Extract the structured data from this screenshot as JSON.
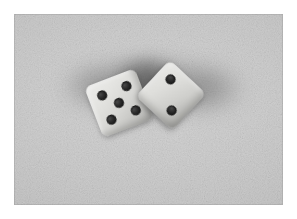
{
  "image": {
    "kind": "photograph",
    "subject": "two white dice on a light gray textured surface",
    "caption": "Two dice resting on a gray surface, left die showing five, right die showing two",
    "alt_text": "Close-up photograph of a pair of white dice with black pips on a gray grainy background",
    "orientation": "landscape",
    "width_px": 297,
    "height_px": 219,
    "border": {
      "style": "white-margin",
      "margin_px": 14,
      "color": "#ffffff"
    },
    "plate": {
      "left_px": 14,
      "top_px": 14,
      "width_px": 269,
      "height_px": 191
    }
  },
  "palette": {
    "page_background": "#ffffff",
    "surface_light": "#d2d2d2",
    "surface_mid": "#c4c4c4",
    "surface_dark": "#b6b6b6",
    "shadow": "#707070",
    "die_highlight": "#ececea",
    "die_midtone": "#d6d6d3",
    "die_shade": "#a4a4a1",
    "pip": "#161616"
  },
  "scene": {
    "total_pip_count": 7,
    "dice_count": 2,
    "shadow": {
      "name": "cast-shadow",
      "description": "soft dark blur spreading behind and beneath both dice",
      "direction": "upward and outward"
    }
  },
  "dice": [
    {
      "id": "die-left",
      "name": "left-die",
      "value": 5,
      "face_label": "five",
      "pip_pattern": "quincunx",
      "rotation_deg": -21,
      "size_px": 54,
      "position": {
        "left_px": 78,
        "top_px": 62
      },
      "pips": [
        {
          "name": "pip-top-left",
          "x_pct": 26,
          "y_pct": 26,
          "size_px": 10
        },
        {
          "name": "pip-top-right",
          "x_pct": 74,
          "y_pct": 26,
          "size_px": 10
        },
        {
          "name": "pip-center",
          "x_pct": 50,
          "y_pct": 50,
          "size_px": 10
        },
        {
          "name": "pip-bottom-left",
          "x_pct": 26,
          "y_pct": 74,
          "size_px": 10
        },
        {
          "name": "pip-bottom-right",
          "x_pct": 74,
          "y_pct": 74,
          "size_px": 10
        }
      ]
    },
    {
      "id": "die-right",
      "name": "right-die",
      "value": 2,
      "face_label": "two",
      "pip_pattern": "diagonal",
      "rotation_deg": 43,
      "size_px": 50,
      "position": {
        "left_px": 132,
        "top_px": 56
      },
      "pips": [
        {
          "name": "pip-upper",
          "x_pct": 28,
          "y_pct": 28,
          "size_px": 10
        },
        {
          "name": "pip-lower",
          "x_pct": 72,
          "y_pct": 72,
          "size_px": 10
        }
      ]
    }
  ]
}
